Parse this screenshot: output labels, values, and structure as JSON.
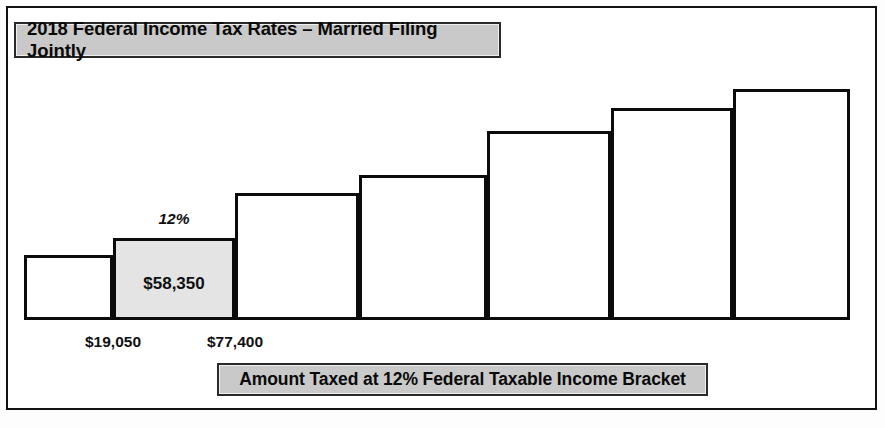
{
  "figure": {
    "title": "2018 Federal Income Tax Rates – Married Filing Jointly",
    "caption": "Amount Taxed at 12% Federal Taxable Income Bracket"
  },
  "annotations": {
    "highlight_rate": "12%",
    "highlight_amount": "$58,350",
    "tick_lower": "$19,050",
    "tick_upper": "$77,400"
  },
  "colors": {
    "bar_outline": "#0b0b0b",
    "bar_fill": "#ffffff",
    "highlight_fill": "#e4e4e4",
    "banner_fill": "#c9c9c9",
    "frame": "#121212"
  },
  "chart_data": {
    "type": "bar",
    "title": "2018 Federal Income Tax Rates – Married Filing Jointly",
    "xlabel": "Amount Taxed at 12% Federal Taxable Income Bracket",
    "ylabel": "",
    "grid": false,
    "legend": null,
    "categories": [
      "1",
      "2",
      "3",
      "4",
      "5",
      "6",
      "7"
    ],
    "values": [
      65,
      82,
      127,
      145,
      189,
      212,
      231
    ],
    "x_edges": [
      24,
      113,
      235,
      359,
      487,
      611,
      733,
      850
    ],
    "baseline_y": 320,
    "highlighted_index": 1,
    "tick_labels": [
      {
        "text": "$19,050",
        "at_x": 113
      },
      {
        "text": "$77,400",
        "at_x": 235
      }
    ],
    "data_labels": [
      {
        "index": 1,
        "inside": "$58,350",
        "above": "12%"
      }
    ]
  },
  "bars": [
    {
      "left": 24,
      "top": 255,
      "width": 89,
      "height": 65,
      "highlight": false
    },
    {
      "left": 113,
      "top": 238,
      "width": 122,
      "height": 82,
      "highlight": true
    },
    {
      "left": 235,
      "top": 193,
      "width": 124,
      "height": 127,
      "highlight": false
    },
    {
      "left": 359,
      "top": 175,
      "width": 128,
      "height": 145,
      "highlight": false
    },
    {
      "left": 487,
      "top": 131,
      "width": 124,
      "height": 189,
      "highlight": false
    },
    {
      "left": 611,
      "top": 108,
      "width": 122,
      "height": 212,
      "highlight": false
    },
    {
      "left": 733,
      "top": 89,
      "width": 117,
      "height": 231,
      "highlight": false
    }
  ]
}
